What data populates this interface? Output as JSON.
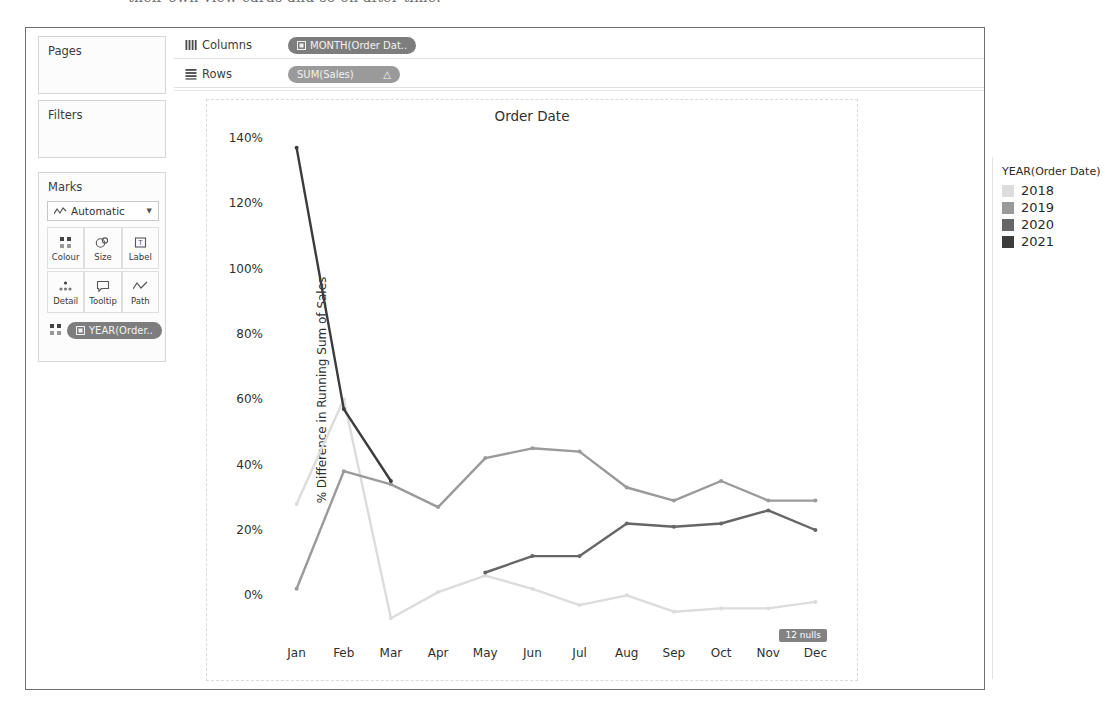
{
  "scan_sliver_text": "their own view cards and so on after time.",
  "left_rail": {
    "pages_card": {
      "title": "Pages"
    },
    "filters_card": {
      "title": "Filters"
    },
    "marks_card": {
      "title": "Marks",
      "mark_type": "Automatic",
      "mark_type_icon": "line-chart-icon",
      "caret_icon": "chevron-down-icon",
      "buttons": [
        {
          "label": "Colour",
          "icon": "colour-squares-icon"
        },
        {
          "label": "Size",
          "icon": "size-circles-icon"
        },
        {
          "label": "Label",
          "icon": "label-text-icon"
        },
        {
          "label": "Detail",
          "icon": "detail-dots-icon"
        },
        {
          "label": "Tooltip",
          "icon": "tooltip-bubble-icon"
        },
        {
          "label": "Path",
          "icon": "path-line-icon"
        }
      ],
      "colour_pill": {
        "label": "YEAR(Order..",
        "icon": "calendar-icon"
      },
      "colour_pill_handle_icon": "colour-squares-icon"
    }
  },
  "shelves": [
    {
      "name": "Columns",
      "icon": "columns-icon",
      "pills": [
        {
          "label": "MONTH(Order Dat..",
          "icon": "calendar-icon",
          "suffix": ""
        }
      ]
    },
    {
      "name": "Rows",
      "icon": "rows-icon",
      "pills": [
        {
          "label": "SUM(Sales)",
          "icon": "",
          "suffix": "△"
        }
      ]
    }
  ],
  "legend": {
    "title": "YEAR(Order Date)",
    "items": [
      {
        "label": "2018",
        "colour": "#dcdcdc"
      },
      {
        "label": "2019",
        "colour": "#9a9a9a"
      },
      {
        "label": "2020",
        "colour": "#666666"
      },
      {
        "label": "2021",
        "colour": "#3c3c3c"
      }
    ]
  },
  "annotations": {
    "nulls_badge": "12 nulls"
  },
  "chart_data": {
    "type": "line",
    "title": "Order Date",
    "xlabel": "",
    "ylabel": "% Difference in Running Sum of Sales",
    "categories": [
      "Jan",
      "Feb",
      "Mar",
      "Apr",
      "May",
      "Jun",
      "Jul",
      "Aug",
      "Sep",
      "Oct",
      "Nov",
      "Dec"
    ],
    "ylim": [
      -10,
      140
    ],
    "ytick_values": [
      0,
      20,
      40,
      60,
      80,
      100,
      120,
      140
    ],
    "ytick_labels": [
      "0%",
      "20%",
      "40%",
      "60%",
      "80%",
      "100%",
      "120%",
      "140%"
    ],
    "grid": false,
    "legend_position": "right",
    "show_markers": true,
    "series": [
      {
        "name": "2018",
        "colour": "#dcdcdc",
        "values": [
          28,
          60,
          -7,
          1,
          6,
          2,
          -3,
          0,
          -5,
          -4,
          -4,
          -2
        ]
      },
      {
        "name": "2019",
        "colour": "#9a9a9a",
        "values": [
          2,
          38,
          34,
          27,
          42,
          45,
          44,
          33,
          29,
          35,
          29,
          29
        ]
      },
      {
        "name": "2020",
        "colour": "#666666",
        "values": [
          null,
          null,
          null,
          null,
          7,
          12,
          12,
          22,
          21,
          22,
          26,
          20
        ]
      },
      {
        "name": "2021",
        "colour": "#3c3c3c",
        "values": [
          137,
          57,
          35,
          null,
          null,
          null,
          null,
          null,
          null,
          null,
          null,
          null
        ]
      }
    ]
  }
}
